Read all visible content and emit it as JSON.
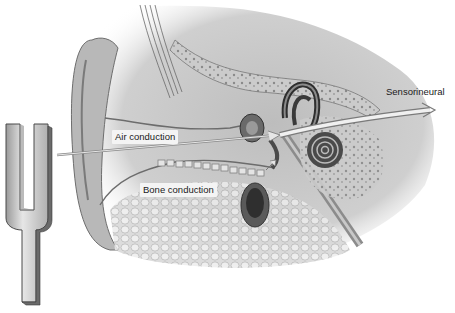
{
  "diagram": {
    "labels": {
      "air_conduction": "Air conduction",
      "bone_conduction": "Bone conduction",
      "sensorineural": "Sensorineural"
    },
    "elements": {
      "tuning_fork": "tuning-fork-icon",
      "air_path": "air-conduction-arrow",
      "bone_path": "bone-conduction-arrow",
      "sensorineural_path": "sensorineural-arrow"
    },
    "colors": {
      "background": "#ffffff",
      "tissue_light": "#d9d9d9",
      "tissue_mid": "#a8a8a8",
      "tissue_dark": "#4a4a4a",
      "fork_fill": "#cfcfcf",
      "fork_edge": "#5a5a5a",
      "arrow": "#e8e8e8",
      "label_bg": "#f4f4f4"
    }
  }
}
